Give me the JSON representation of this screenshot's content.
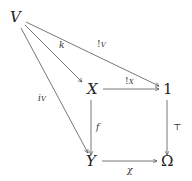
{
  "diagram": {
    "type": "commutative-diagram",
    "nodes": {
      "V": "V",
      "X": "X",
      "one": "1",
      "Y": "Y",
      "Omega": "Ω"
    },
    "arrows": {
      "k": {
        "from": "V",
        "to": "X",
        "label": "k"
      },
      "bang_V": {
        "from": "V",
        "to": "1",
        "label": "!V"
      },
      "i_V": {
        "from": "V",
        "to": "Y",
        "label": "iV"
      },
      "bang_X": {
        "from": "X",
        "to": "1",
        "label": "!X"
      },
      "f": {
        "from": "X",
        "to": "Y",
        "label": "f"
      },
      "top": {
        "from": "1",
        "to": "Ω",
        "label": "⊤"
      },
      "chi": {
        "from": "Y",
        "to": "Ω",
        "label": "χ"
      }
    },
    "labels": {
      "k": "k",
      "bang_V_main": "!",
      "bang_V_sub": "V",
      "bang_X_main": "!",
      "bang_X_sub": "X",
      "i_V_main": "i",
      "i_V_sub": "V",
      "f": "f",
      "top": "⊤",
      "chi": "χ"
    },
    "stroke_color": "#444444"
  }
}
